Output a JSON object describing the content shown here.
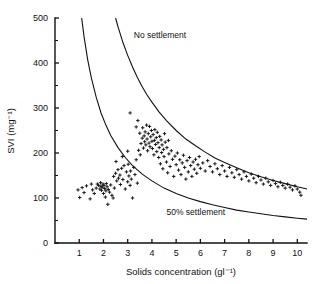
{
  "chart_data": {
    "type": "scatter",
    "title": "",
    "xlabel": "Solids concentration (gl⁻¹)",
    "ylabel": "SVI (mg⁻¹)",
    "xlim": [
      0,
      10.4
    ],
    "ylim": [
      0,
      500
    ],
    "xticks": [
      1,
      2,
      3,
      4,
      5,
      6,
      7,
      8,
      9,
      10
    ],
    "xtick_labels": [
      "1",
      "2",
      "3",
      "4",
      "5",
      "6",
      "7",
      "8",
      "9",
      "10"
    ],
    "yticks": [
      0,
      100,
      200,
      300,
      400,
      500
    ],
    "ytick_labels": [
      "0",
      "100",
      "200",
      "300",
      "400",
      "500"
    ],
    "yticks_minor": [
      50,
      150,
      250,
      350,
      450
    ],
    "grid": false,
    "legend": null,
    "marker": "plus",
    "marker_color": "#111111",
    "axis_color": "#111111",
    "annotations": [
      {
        "text": "No settlement",
        "x": 3.25,
        "y": 455,
        "name": "no-settlement-label"
      },
      {
        "text": "50% settlement",
        "x": 4.6,
        "y": 63,
        "name": "fifty-percent-settlement-label"
      }
    ],
    "curves": [
      {
        "name": "no-settlement-curve",
        "label": "No settlement",
        "description": "Upper hyperbolic boundary SVI = k/C, k = 1250",
        "k": 1250,
        "points": [
          [
            2.5,
            500
          ],
          [
            2.6,
            481
          ],
          [
            2.8,
            446
          ],
          [
            3.0,
            417
          ],
          [
            3.2,
            391
          ],
          [
            3.4,
            368
          ],
          [
            3.6,
            347
          ],
          [
            3.8,
            329
          ],
          [
            4.0,
            313
          ],
          [
            4.3,
            291
          ],
          [
            4.6,
            272
          ],
          [
            5.0,
            250
          ],
          [
            5.4,
            231
          ],
          [
            5.8,
            216
          ],
          [
            6.2,
            202
          ],
          [
            6.6,
            189
          ],
          [
            7.0,
            179
          ],
          [
            7.5,
            167
          ],
          [
            8.0,
            156
          ],
          [
            8.5,
            147
          ],
          [
            9.0,
            139
          ],
          [
            9.5,
            132
          ],
          [
            10.0,
            125
          ],
          [
            10.4,
            120
          ]
        ]
      },
      {
        "name": "fifty-percent-settlement-curve",
        "label": "50% settlement",
        "description": "Lower hyperbolic boundary SVI = k/C, k = 550",
        "k": 550,
        "points": [
          [
            1.1,
            500
          ],
          [
            1.2,
            458
          ],
          [
            1.35,
            407
          ],
          [
            1.5,
            367
          ],
          [
            1.7,
            324
          ],
          [
            1.9,
            289
          ],
          [
            2.1,
            262
          ],
          [
            2.3,
            239
          ],
          [
            2.6,
            212
          ],
          [
            2.9,
            190
          ],
          [
            3.2,
            172
          ],
          [
            3.6,
            153
          ],
          [
            4.0,
            138
          ],
          [
            4.5,
            122
          ],
          [
            5.0,
            110
          ],
          [
            5.5,
            100
          ],
          [
            6.0,
            92
          ],
          [
            6.5,
            85
          ],
          [
            7.0,
            79
          ],
          [
            7.5,
            73
          ],
          [
            8.0,
            69
          ],
          [
            8.5,
            65
          ],
          [
            9.0,
            61
          ],
          [
            9.5,
            58
          ],
          [
            10.0,
            55
          ],
          [
            10.4,
            53
          ]
        ]
      }
    ],
    "series": [
      {
        "name": "sludge-samples",
        "label": "SVI measurements",
        "n_points": 172,
        "points": [
          [
            0.95,
            118
          ],
          [
            1.02,
            101
          ],
          [
            1.12,
            123
          ],
          [
            1.2,
            112
          ],
          [
            1.3,
            127
          ],
          [
            1.45,
            98
          ],
          [
            1.5,
            131
          ],
          [
            1.55,
            118
          ],
          [
            1.62,
            110
          ],
          [
            1.7,
            122
          ],
          [
            1.75,
            131
          ],
          [
            1.8,
            128
          ],
          [
            1.85,
            120
          ],
          [
            1.88,
            134
          ],
          [
            1.9,
            126
          ],
          [
            1.92,
            117
          ],
          [
            1.95,
            124
          ],
          [
            1.98,
            131
          ],
          [
            2.0,
            110
          ],
          [
            2.02,
            128
          ],
          [
            2.05,
            121
          ],
          [
            2.08,
            102
          ],
          [
            2.1,
            116
          ],
          [
            2.12,
            132
          ],
          [
            2.15,
            125
          ],
          [
            2.18,
            86
          ],
          [
            2.2,
            119
          ],
          [
            2.25,
            113
          ],
          [
            2.3,
            129
          ],
          [
            2.35,
            106
          ],
          [
            2.4,
            100
          ],
          [
            2.42,
            148
          ],
          [
            2.45,
            122
          ],
          [
            2.5,
            155
          ],
          [
            2.55,
            138
          ],
          [
            2.6,
            163
          ],
          [
            2.62,
            144
          ],
          [
            2.68,
            151
          ],
          [
            2.7,
            130
          ],
          [
            2.75,
            166
          ],
          [
            2.8,
            141
          ],
          [
            2.85,
            172
          ],
          [
            2.9,
            120
          ],
          [
            2.95,
            158
          ],
          [
            3.0,
            136
          ],
          [
            3.02,
            175
          ],
          [
            3.05,
            149
          ],
          [
            3.1,
            128
          ],
          [
            3.12,
            160
          ],
          [
            3.15,
            142
          ],
          [
            3.2,
            100
          ],
          [
            3.25,
            168
          ],
          [
            3.3,
            152
          ],
          [
            3.35,
            185
          ],
          [
            3.4,
            133
          ],
          [
            3.45,
            206
          ],
          [
            3.5,
            244
          ],
          [
            3.52,
            196
          ],
          [
            3.55,
            221
          ],
          [
            3.6,
            233
          ],
          [
            3.62,
            256
          ],
          [
            3.65,
            211
          ],
          [
            3.68,
            238
          ],
          [
            3.7,
            225
          ],
          [
            3.72,
            247
          ],
          [
            3.75,
            218
          ],
          [
            3.78,
            262
          ],
          [
            3.8,
            231
          ],
          [
            3.82,
            205
          ],
          [
            3.85,
            243
          ],
          [
            3.88,
            222
          ],
          [
            3.9,
            259
          ],
          [
            3.92,
            214
          ],
          [
            3.95,
            236
          ],
          [
            3.98,
            250
          ],
          [
            4.0,
            226
          ],
          [
            4.02,
            210
          ],
          [
            4.05,
            241
          ],
          [
            4.08,
            196
          ],
          [
            4.1,
            228
          ],
          [
            4.12,
            252
          ],
          [
            4.15,
            219
          ],
          [
            4.18,
            234
          ],
          [
            4.2,
            203
          ],
          [
            4.22,
            246
          ],
          [
            4.25,
            223
          ],
          [
            4.28,
            190
          ],
          [
            4.3,
            212
          ],
          [
            4.32,
            237
          ],
          [
            4.35,
            176
          ],
          [
            4.38,
            229
          ],
          [
            4.4,
            201
          ],
          [
            4.42,
            218
          ],
          [
            4.45,
            165
          ],
          [
            4.48,
            208
          ],
          [
            4.5,
            192
          ],
          [
            4.55,
            224
          ],
          [
            4.6,
            180
          ],
          [
            4.62,
            212
          ],
          [
            4.65,
            156
          ],
          [
            4.7,
            198
          ],
          [
            4.75,
            170
          ],
          [
            4.8,
            205
          ],
          [
            4.85,
            186
          ],
          [
            4.9,
            148
          ],
          [
            4.95,
            193
          ],
          [
            5.0,
            174
          ],
          [
            5.05,
            200
          ],
          [
            5.1,
            162
          ],
          [
            5.15,
            185
          ],
          [
            5.2,
            152
          ],
          [
            5.25,
            178
          ],
          [
            5.3,
            195
          ],
          [
            5.35,
            168
          ],
          [
            5.4,
            142
          ],
          [
            5.45,
            183
          ],
          [
            5.5,
            158
          ],
          [
            5.55,
            190
          ],
          [
            5.6,
            172
          ],
          [
            5.65,
            148
          ],
          [
            5.7,
            180
          ],
          [
            5.75,
            164
          ],
          [
            5.8,
            186
          ],
          [
            5.85,
            155
          ],
          [
            5.9,
            174
          ],
          [
            5.95,
            192
          ],
          [
            6.0,
            166
          ],
          [
            6.1,
            178
          ],
          [
            6.2,
            160
          ],
          [
            6.3,
            183
          ],
          [
            6.4,
            170
          ],
          [
            6.5,
            158
          ],
          [
            6.6,
            176
          ],
          [
            6.7,
            165
          ],
          [
            6.8,
            152
          ],
          [
            6.9,
            172
          ],
          [
            7.0,
            160
          ],
          [
            7.1,
            148
          ],
          [
            7.2,
            168
          ],
          [
            7.3,
            156
          ],
          [
            7.4,
            146
          ],
          [
            7.5,
            163
          ],
          [
            7.6,
            152
          ],
          [
            7.7,
            142
          ],
          [
            7.8,
            158
          ],
          [
            7.9,
            148
          ],
          [
            8.0,
            138
          ],
          [
            8.1,
            153
          ],
          [
            8.2,
            144
          ],
          [
            8.3,
            134
          ],
          [
            8.4,
            148
          ],
          [
            8.5,
            140
          ],
          [
            8.6,
            131
          ],
          [
            8.7,
            144
          ],
          [
            8.8,
            136
          ],
          [
            8.9,
            128
          ],
          [
            9.0,
            139
          ],
          [
            9.1,
            132
          ],
          [
            9.2,
            125
          ],
          [
            9.3,
            135
          ],
          [
            9.4,
            128
          ],
          [
            9.5,
            122
          ],
          [
            9.6,
            131
          ],
          [
            9.7,
            124
          ],
          [
            9.8,
            118
          ],
          [
            9.9,
            127
          ],
          [
            10.0,
            120
          ],
          [
            10.1,
            113
          ],
          [
            10.15,
            106
          ],
          [
            3.1,
            289
          ],
          [
            3.35,
            258
          ],
          [
            3.42,
            272
          ],
          [
            2.52,
            181
          ],
          [
            2.78,
            192
          ],
          [
            3.0,
            204
          ],
          [
            4.52,
            243
          ],
          [
            4.68,
            228
          ]
        ]
      }
    ]
  }
}
